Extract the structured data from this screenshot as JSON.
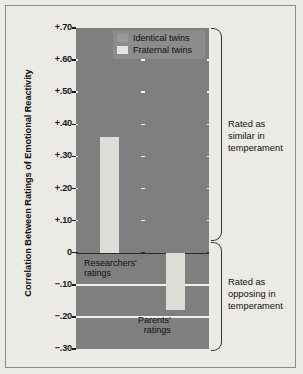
{
  "chart_data": {
    "type": "bar",
    "title": "",
    "xlabel": "",
    "ylabel": "Correlation Between Ratings of Emotional Reactivity",
    "ylim": [
      -0.3,
      0.7
    ],
    "ytick_labels": [
      "+.70",
      "+.60",
      "+.50",
      "+.40",
      "+.30",
      "+.20",
      "+.10",
      "0",
      "−.10",
      "−.20",
      "−.30"
    ],
    "ytick_values": [
      0.7,
      0.6,
      0.5,
      0.4,
      0.3,
      0.2,
      0.1,
      0.0,
      -0.1,
      -0.2,
      -0.3
    ],
    "grid": true,
    "legend_position": "top-right-inside",
    "categories": [
      "Researchers' ratings",
      "Parents' ratings"
    ],
    "series": [
      {
        "name": "Identical twins",
        "color": "#7f7f7f",
        "values": [
          0.7,
          0.7
        ]
      },
      {
        "name": "Fraternal twins",
        "color": "#dedcd6",
        "values": [
          0.36,
          -0.18
        ]
      }
    ],
    "annotations": [
      "Rated as similar in temperament",
      "Rated as opposing in temperament"
    ]
  },
  "legend": {
    "items": [
      {
        "label": "Identical twins",
        "color": "#9a9a9a"
      },
      {
        "label": "Fraternal twins",
        "color": "#e6e4de"
      }
    ]
  },
  "axis": {
    "y_title": "Correlation Between Ratings of Emotional Reactivity",
    "ticks": [
      {
        "label": "+.70",
        "value": 0.7
      },
      {
        "label": "+.60",
        "value": 0.6
      },
      {
        "label": "+.50",
        "value": 0.5
      },
      {
        "label": "+.40",
        "value": 0.4
      },
      {
        "label": "+.30",
        "value": 0.3
      },
      {
        "label": "+.20",
        "value": 0.2
      },
      {
        "label": "+.10",
        "value": 0.1
      },
      {
        "label": "0",
        "value": 0.0
      },
      {
        "label": "−.10",
        "value": -0.1
      },
      {
        "label": "−.20",
        "value": -0.2
      },
      {
        "label": "−.30",
        "value": -0.3
      }
    ]
  },
  "plot_labels": {
    "researchers": "Researchers'\nratings",
    "researchers_line1": "Researchers'",
    "researchers_line2": "ratings",
    "parents_line1": "Parents'",
    "parents_line2": "ratings"
  },
  "annotations": {
    "top_line1": "Rated as",
    "top_line2": "similar in",
    "top_line3": "temperament",
    "bottom_line1": "Rated as",
    "bottom_line2": "opposing in",
    "bottom_line3": "temperament"
  },
  "colors": {
    "identical": "#7f7f7f",
    "fraternal": "#dedcd6",
    "background": "#eceae5",
    "gridline": "#f2f0ec",
    "zeroline": "#2b2b2b"
  }
}
